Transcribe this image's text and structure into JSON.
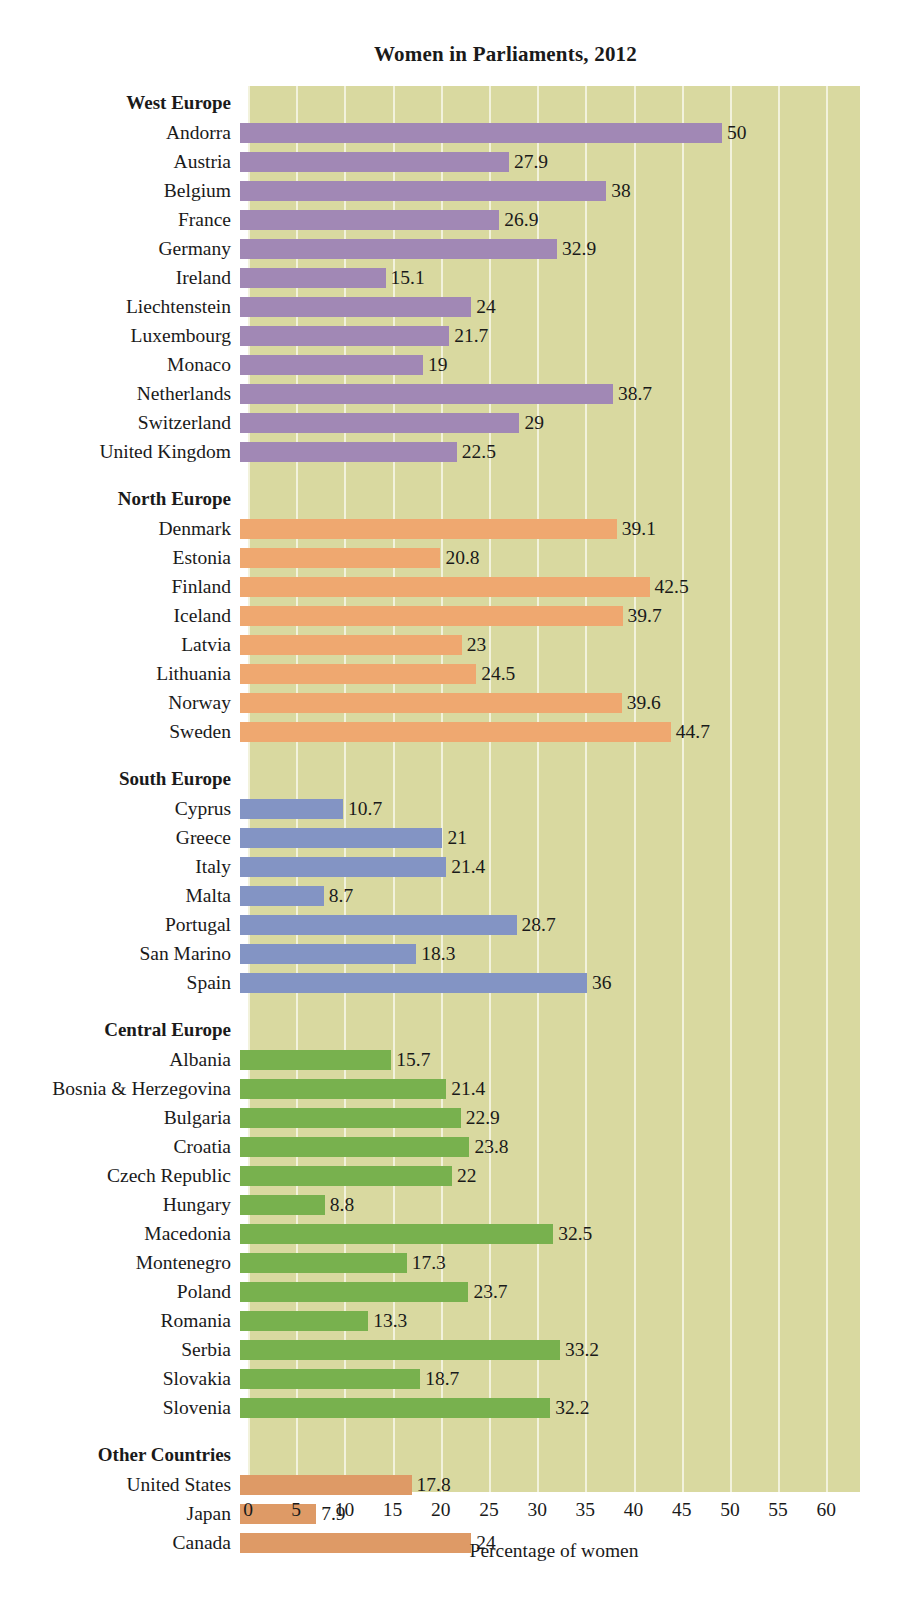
{
  "chart_data": {
    "type": "bar",
    "orientation": "horizontal",
    "title": "Women in Parliaments, 2012",
    "xlabel": "Percentage of women",
    "ylabel": "",
    "xlim": [
      0,
      63.5
    ],
    "xticks": [
      0,
      5,
      10,
      15,
      20,
      25,
      30,
      35,
      40,
      45,
      50,
      55,
      60
    ],
    "xtick_labels": [
      "0",
      "5",
      "10",
      "15",
      "20",
      "25",
      "30",
      "35",
      "40",
      "45",
      "50",
      "55",
      "60"
    ],
    "grid": true,
    "legend": "none",
    "plot_background": "#d9d9a0",
    "gridline_color": "#f2f2dc",
    "groups": [
      {
        "name": "West Europe",
        "color": "#a188b5",
        "categories": [
          "Andorra",
          "Austria",
          "Belgium",
          "France",
          "Germany",
          "Ireland",
          "Liechtenstein",
          "Luxembourg",
          "Monaco",
          "Netherlands",
          "Switzerland",
          "United Kingdom"
        ],
        "values": [
          50,
          27.9,
          38,
          26.9,
          32.9,
          15.1,
          24,
          21.7,
          19,
          38.7,
          29,
          22.5
        ],
        "labels": [
          "50",
          "27.9",
          "38",
          "26.9",
          "32.9",
          "15.1",
          "24",
          "21.7",
          "19",
          "38.7",
          "29",
          "22.5"
        ]
      },
      {
        "name": "North Europe",
        "color": "#efa870",
        "categories": [
          "Denmark",
          "Estonia",
          "Finland",
          "Iceland",
          "Latvia",
          "Lithuania",
          "Norway",
          "Sweden"
        ],
        "values": [
          39.1,
          20.8,
          42.5,
          39.7,
          23,
          24.5,
          39.6,
          44.7
        ],
        "labels": [
          "39.1",
          "20.8",
          "42.5",
          "39.7",
          "23",
          "24.5",
          "39.6",
          "44.7"
        ]
      },
      {
        "name": "South Europe",
        "color": "#8394c4",
        "categories": [
          "Cyprus",
          "Greece",
          "Italy",
          "Malta",
          "Portugal",
          "San Marino",
          "Spain"
        ],
        "values": [
          10.7,
          21,
          21.4,
          8.7,
          28.7,
          18.3,
          36
        ],
        "labels": [
          "10.7",
          "21",
          "21.4",
          "8.7",
          "28.7",
          "18.3",
          "36"
        ]
      },
      {
        "name": "Central Europe",
        "color": "#78b14e",
        "categories": [
          "Albania",
          "Bosnia & Herzegovina",
          "Bulgaria",
          "Croatia",
          "Czech Republic",
          "Hungary",
          "Macedonia",
          "Montenegro",
          "Poland",
          "Romania",
          "Serbia",
          "Slovakia",
          "Slovenia"
        ],
        "values": [
          15.7,
          21.4,
          22.9,
          23.8,
          22,
          8.8,
          32.5,
          17.3,
          23.7,
          13.3,
          33.2,
          18.7,
          32.2
        ],
        "labels": [
          "15.7",
          "21.4",
          "22.9",
          "23.8",
          "22",
          "8.8",
          "32.5",
          "17.3",
          "23.7",
          "13.3",
          "33.2",
          "18.7",
          "32.2"
        ]
      },
      {
        "name": "Other Countries",
        "color": "#de9a66",
        "categories": [
          "United States",
          "Japan",
          "Canada"
        ],
        "values": [
          17.8,
          7.9,
          24
        ],
        "labels": [
          "17.8",
          "7.9",
          "24"
        ]
      }
    ]
  }
}
